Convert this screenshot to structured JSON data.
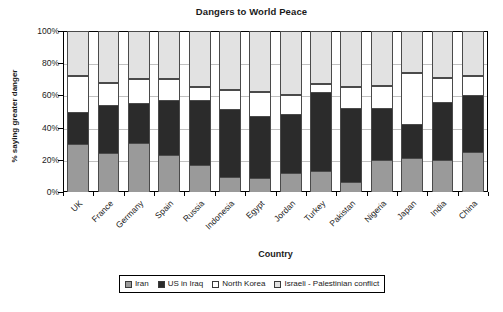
{
  "chart_data": {
    "type": "bar",
    "subtype": "stacked-100-percent",
    "title": "Dangers to World Peace",
    "xlabel": "Country",
    "ylabel": "% saying greater danger",
    "ylim": [
      0,
      100
    ],
    "ytick_labels": [
      "100%",
      "80%",
      "60%",
      "40%",
      "20%",
      "0%"
    ],
    "ytick_values": [
      100,
      80,
      60,
      40,
      20,
      0
    ],
    "grid": true,
    "legend_position": "bottom",
    "categories": [
      "UK",
      "France",
      "Germany",
      "Spain",
      "Russia",
      "Indonesia",
      "Egypt",
      "Jordan",
      "Turkey",
      "Pakistan",
      "Nigeria",
      "Japan",
      "India",
      "China"
    ],
    "series": [
      {
        "name": "Iran",
        "color": "#9a9a9a",
        "values": [
          30,
          24,
          30.5,
          23,
          17,
          9.5,
          8.5,
          12,
          13,
          6.5,
          20,
          21,
          20,
          25
        ]
      },
      {
        "name": "US in Iraq",
        "color": "#2b2b2b",
        "values": [
          20,
          30,
          25,
          34,
          40,
          42,
          38.5,
          36.5,
          49,
          46,
          32,
          21,
          36,
          35
        ]
      },
      {
        "name": "North Korea",
        "color": "#ffffff",
        "values": [
          22,
          14,
          14.5,
          13,
          8,
          12,
          15,
          11.5,
          5,
          12.5,
          14,
          32,
          15,
          12
        ]
      },
      {
        "name": "Israeli - Palestinian conflict",
        "color": "#e2e2e2",
        "values": [
          28,
          32,
          30,
          30,
          35,
          36.5,
          38,
          40,
          33,
          35,
          34,
          26,
          29,
          28
        ]
      }
    ],
    "cumulative_tops": {
      "iran": [
        30,
        24,
        30.5,
        23,
        17,
        9.5,
        8.5,
        12,
        13,
        6.5,
        20,
        21,
        20,
        25
      ],
      "us_in_iraq": [
        50,
        54,
        55.5,
        57,
        57,
        51.5,
        47,
        48.5,
        62,
        52.5,
        52,
        42,
        56,
        60
      ],
      "north_korea": [
        72,
        68,
        70,
        70,
        65,
        63.5,
        62,
        60,
        67,
        65,
        66,
        74,
        71,
        72
      ],
      "israeli": [
        100,
        100,
        100,
        100,
        100,
        100,
        100,
        100,
        100,
        100,
        100,
        100,
        100,
        100
      ]
    }
  }
}
